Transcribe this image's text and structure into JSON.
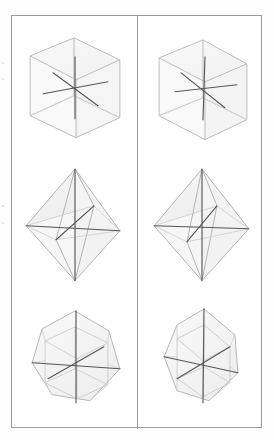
{
  "figure": {
    "columns": 2,
    "rows": 3,
    "frame": {
      "border_color": "#9a9a9a",
      "background": "#ffffff",
      "divider_color": "#9a9a9a"
    },
    "colors": {
      "edge_line": "#b9b9b9",
      "hidden_edge_line": "#d8d8d8",
      "axis_line": "#555555",
      "face_fill": "#f4f4f4",
      "paper": "#fefefe"
    },
    "panels": [
      {
        "id": "panel-cube-left",
        "row": 1,
        "column": 1,
        "shape": "cube",
        "shape_label": "Cube",
        "axes_count": 3,
        "orientation": "view-a"
      },
      {
        "id": "panel-cube-right",
        "row": 1,
        "column": 2,
        "shape": "cube",
        "shape_label": "Cube",
        "axes_count": 3,
        "orientation": "view-b"
      },
      {
        "id": "panel-octahedron-left",
        "row": 2,
        "column": 1,
        "shape": "octahedron",
        "shape_label": "Octahedron",
        "axes_count": 3,
        "orientation": "view-a"
      },
      {
        "id": "panel-octahedron-right",
        "row": 2,
        "column": 2,
        "shape": "octahedron",
        "shape_label": "Octahedron",
        "axes_count": 3,
        "orientation": "view-b"
      },
      {
        "id": "panel-cuboctahedron-left",
        "row": 3,
        "column": 1,
        "shape": "cuboctahedron",
        "shape_label": "Cuboctahedron",
        "axes_count": 3,
        "orientation": "view-a"
      },
      {
        "id": "panel-cuboctahedron-right",
        "row": 3,
        "column": 2,
        "shape": "cuboctahedron",
        "shape_label": "Cuboctahedron",
        "axes_count": 3,
        "orientation": "view-b"
      }
    ]
  }
}
